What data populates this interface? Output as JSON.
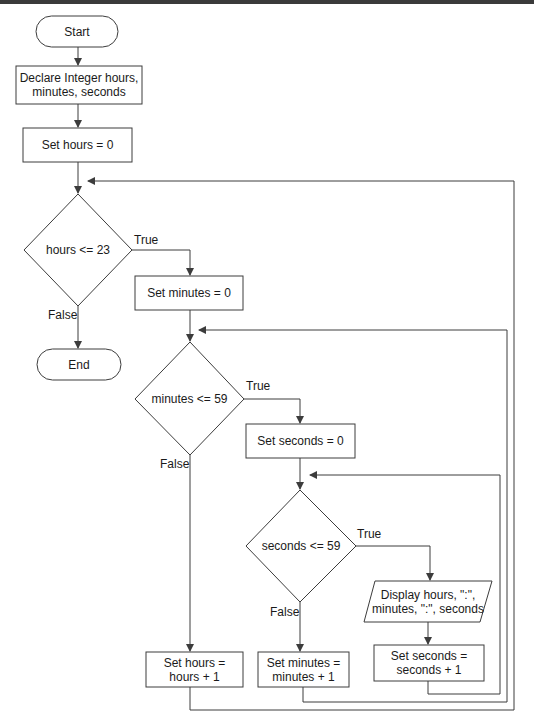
{
  "diagram": {
    "type": "flowchart",
    "nodes": {
      "start": {
        "label": "Start",
        "shape": "terminal"
      },
      "declare": {
        "label_line1": "Declare Integer hours,",
        "label_line2": "minutes, seconds",
        "shape": "process"
      },
      "set_hours_0": {
        "label": "Set hours = 0",
        "shape": "process"
      },
      "hours_check": {
        "label": "hours <= 23",
        "shape": "decision"
      },
      "end": {
        "label": "End",
        "shape": "terminal"
      },
      "set_minutes_0": {
        "label": "Set minutes = 0",
        "shape": "process"
      },
      "minutes_check": {
        "label": "minutes <= 59",
        "shape": "decision"
      },
      "set_seconds_0": {
        "label": "Set seconds = 0",
        "shape": "process"
      },
      "seconds_check": {
        "label": "seconds <= 59",
        "shape": "decision"
      },
      "display": {
        "label_line1": "Display hours, \":\",",
        "label_line2": "minutes, \":\", seconds",
        "shape": "input-output"
      },
      "inc_seconds": {
        "label_line1": "Set seconds =",
        "label_line2": "seconds + 1",
        "shape": "process"
      },
      "inc_minutes": {
        "label_line1": "Set minutes =",
        "label_line2": "minutes + 1",
        "shape": "process"
      },
      "inc_hours": {
        "label_line1": "Set hours =",
        "label_line2": "hours + 1",
        "shape": "process"
      }
    },
    "edge_labels": {
      "hours_true": "True",
      "hours_false": "False",
      "minutes_true": "True",
      "minutes_false": "False",
      "seconds_true": "True",
      "seconds_false": "False"
    },
    "edges": [
      [
        "start",
        "declare"
      ],
      [
        "declare",
        "set_hours_0"
      ],
      [
        "set_hours_0",
        "hours_check"
      ],
      [
        "hours_check",
        "set_minutes_0",
        "True"
      ],
      [
        "hours_check",
        "end",
        "False"
      ],
      [
        "set_minutes_0",
        "minutes_check"
      ],
      [
        "minutes_check",
        "set_seconds_0",
        "True"
      ],
      [
        "minutes_check",
        "inc_hours",
        "False"
      ],
      [
        "set_seconds_0",
        "seconds_check"
      ],
      [
        "seconds_check",
        "display",
        "True"
      ],
      [
        "seconds_check",
        "inc_minutes",
        "False"
      ],
      [
        "display",
        "inc_seconds"
      ],
      [
        "inc_seconds",
        "seconds_check"
      ],
      [
        "inc_minutes",
        "minutes_check"
      ],
      [
        "inc_hours",
        "hours_check"
      ]
    ],
    "colors": {
      "stroke": "#3c3c3c",
      "text": "#1a1a1a",
      "background": "#ffffff"
    }
  }
}
